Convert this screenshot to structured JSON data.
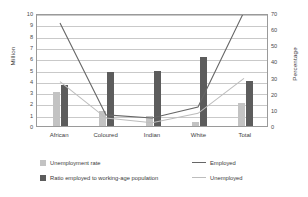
{
  "chart_data": {
    "type": "bar",
    "title": "",
    "xlabel": "",
    "ylabel": "Million",
    "ylabel_secondary": "Percentage",
    "categories": [
      "African",
      "Coloured",
      "Indian",
      "White",
      "Total"
    ],
    "ylim": [
      0,
      10
    ],
    "ylim_secondary": [
      0,
      70
    ],
    "yticks": [
      0,
      1,
      2,
      3,
      4,
      5,
      6,
      7,
      8,
      9,
      10
    ],
    "yticks_secondary": [
      0,
      10,
      20,
      30,
      40,
      50,
      60,
      70
    ],
    "grid": true,
    "legend_position": "bottom",
    "series": [
      {
        "name": "Unemployment rate",
        "type": "bar",
        "axis": "left",
        "color": "#c3c3c3",
        "values": [
          3.0,
          1.3,
          0.9,
          0.35,
          2.0
        ]
      },
      {
        "name": "Ratio employed to working-age population",
        "type": "bar",
        "axis": "left",
        "color": "#5c5c5c",
        "values": [
          3.6,
          4.8,
          4.9,
          6.1,
          4.0
        ]
      },
      {
        "name": "Employed",
        "type": "line",
        "axis": "right",
        "color": "#666666",
        "values": [
          65,
          7,
          5,
          12,
          72
        ]
      },
      {
        "name": "Unemployed",
        "type": "line",
        "axis": "right",
        "color": "#bdbdbd",
        "values": [
          28,
          5,
          2,
          8,
          30
        ]
      }
    ]
  },
  "legend": {
    "items": [
      {
        "label": "Unemployment rate",
        "marker": "bar-swatch-light"
      },
      {
        "label": "Ratio employed to working-age population",
        "marker": "bar-swatch-dark"
      },
      {
        "label": "Employed",
        "marker": "line-dark"
      },
      {
        "label": "Unemployed",
        "marker": "line-light"
      }
    ]
  }
}
